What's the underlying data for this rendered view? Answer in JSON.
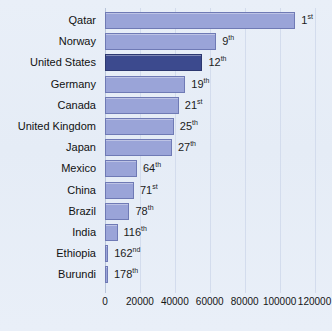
{
  "chart_data": {
    "type": "bar",
    "orientation": "horizontal",
    "title": "",
    "subtitle": "",
    "xlabel": "",
    "ylabel": "",
    "xlim": [
      0,
      130000
    ],
    "grid": true,
    "legend_position": "none",
    "xticks": [
      0,
      20000,
      40000,
      60000,
      80000,
      100000,
      120000
    ],
    "xtick_labels": [
      "0",
      "20000",
      "40000",
      "60000",
      "80000",
      "100000",
      "120000"
    ],
    "categories": [
      "Qatar",
      "Norway",
      "United States",
      "Germany",
      "Canada",
      "United Kingdom",
      "Japan",
      "Mexico",
      "China",
      "Brazil",
      "India",
      "Ethiopia",
      "Burundi"
    ],
    "values": [
      109000,
      63700,
      55800,
      46000,
      42300,
      39400,
      38300,
      18300,
      16600,
      14000,
      7200,
      1800,
      1100
    ],
    "annotations": [
      "1st",
      "9th",
      "12th",
      "19th",
      "21st",
      "25th",
      "27th",
      "64th",
      "71st",
      "78th",
      "116th",
      "162nd",
      "178th"
    ],
    "annotation_numbers": [
      "1",
      "9",
      "12",
      "19",
      "21",
      "25",
      "27",
      "64",
      "71",
      "78",
      "116",
      "162",
      "178"
    ],
    "annotation_suffixes": [
      "st",
      "th",
      "th",
      "th",
      "st",
      "th",
      "th",
      "th",
      "st",
      "th",
      "th",
      "nd",
      "th"
    ],
    "highlight_index": 2,
    "colors": {
      "bar": "#9aa4d8",
      "bar_border": "#6f7ab5",
      "highlight_bar": "#3c4a8e",
      "highlight_border": "#2d3870",
      "background": "#e8eef7",
      "gridline": "#d3dced",
      "text": "#111111"
    }
  }
}
